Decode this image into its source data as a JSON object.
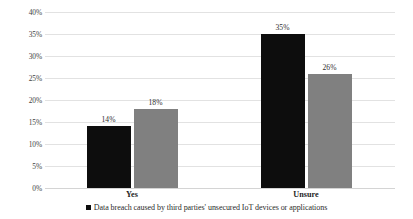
{
  "chart_data": {
    "type": "bar",
    "title": "",
    "xlabel": "",
    "ylabel": "",
    "categories": [
      "Yes",
      "Unsure"
    ],
    "series": [
      {
        "name": "Data breach caused by third parties' unsecured IoT devices or applications",
        "color": "#0d0d0d",
        "values": [
          14,
          18
        ]
      },
      {
        "name": "series-b",
        "color": "#808080",
        "values": [
          18,
          26
        ]
      }
    ],
    "bars": [
      {
        "category": "Yes",
        "series": "series-a",
        "value": 14,
        "label": "14%",
        "color": "#0d0d0d"
      },
      {
        "category": "Yes",
        "series": "series-b",
        "value": 18,
        "label": "18%",
        "color": "#808080"
      },
      {
        "category": "Unsure",
        "series": "series-a",
        "value": 35,
        "label": "35%",
        "color": "#0d0d0d"
      },
      {
        "category": "Unsure",
        "series": "series-b",
        "value": 26,
        "label": "26%",
        "color": "#808080"
      }
    ],
    "ylim": [
      0,
      40
    ],
    "ytick_values": [
      40,
      35,
      30,
      25,
      20,
      15,
      10,
      5,
      0
    ],
    "ytick_labels": [
      "40%",
      "35%",
      "30%",
      "25%",
      "20%",
      "15%",
      "10%",
      "5%",
      "0%"
    ],
    "grid": true,
    "legend_position": "bottom"
  },
  "legend": {
    "marker": "black-square-marker",
    "text": "Data breach caused by third parties' unsecured IoT devices or applications"
  },
  "colors": {
    "series_a": "#0d0d0d",
    "series_b": "#808080",
    "gridline": "#e2e2e2",
    "background": "#ffffff"
  }
}
